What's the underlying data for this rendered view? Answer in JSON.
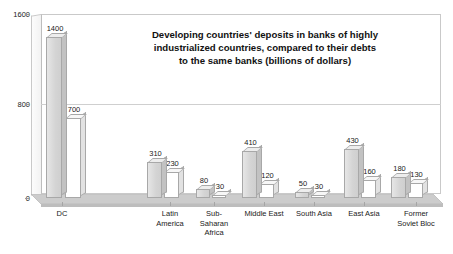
{
  "chart_data": {
    "type": "bar",
    "title": "Developing countries' deposits in banks of highly industrialized countries, compared to their debts to the same banks (billions of dollars)",
    "title_lines": [
      "Developing countries' deposits in banks of highly",
      "industrialized countries, compared to their debts",
      "to the same banks (billions of dollars)"
    ],
    "xlabel": "",
    "ylabel": "",
    "ylim": [
      0,
      1600
    ],
    "yticks": [
      0,
      800,
      1600
    ],
    "ytick_labels": [
      "0",
      "800",
      "1600"
    ],
    "grid": true,
    "legend": "none",
    "categories": [
      "DC",
      "Latin America",
      "Sub-Saharan Africa",
      "Middle East",
      "South Asia",
      "East Asia",
      "Former Soviet Bloc"
    ],
    "category_labels": [
      "DC",
      "Latin\nAmerica",
      "Sub-\nSaharan\nAfrica",
      "Middle East",
      "South Asia",
      "East Asia",
      "Former\nSoviet Bloc"
    ],
    "series": [
      {
        "name": "Deposits",
        "values": [
          1400,
          310,
          80,
          410,
          50,
          430,
          180
        ],
        "color": "#d4d4d4"
      },
      {
        "name": "Debts",
        "values": [
          700,
          230,
          30,
          120,
          30,
          160,
          130
        ],
        "color": "#ffffff"
      }
    ]
  },
  "style": {
    "background": "#ffffff",
    "text_color": "#1a1a1a",
    "frame_color": "#c9c9c9",
    "floor_color": "#c4c4c4"
  }
}
